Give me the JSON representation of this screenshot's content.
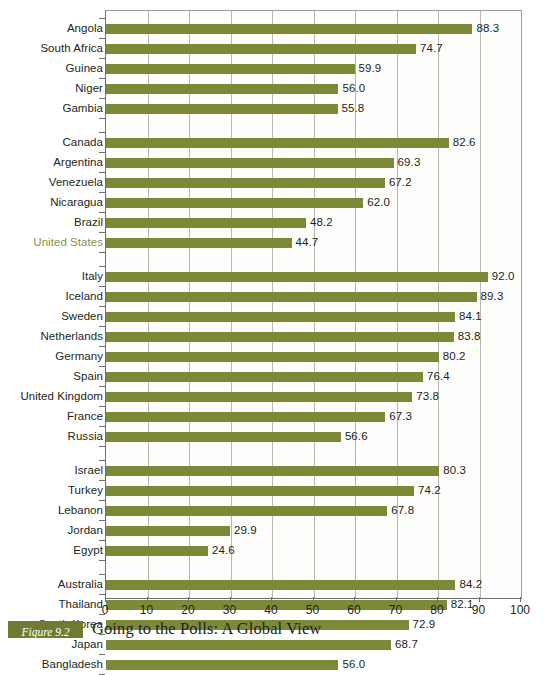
{
  "caption": {
    "figure_label": "Figure 9.2",
    "title": "Going to the Polls: A Global View"
  },
  "chart_data": {
    "type": "bar",
    "orientation": "horizontal",
    "title": "Going to the Polls: A Global View",
    "xlabel": "",
    "ylabel": "",
    "xlim": [
      0,
      100
    ],
    "xticks": [
      0,
      10,
      20,
      30,
      40,
      50,
      60,
      70,
      80,
      90,
      100
    ],
    "grid": true,
    "grid_axis": "x",
    "legend": "none",
    "bar_color": "#7c8a38",
    "highlight_color": "#8a8f4a",
    "highlighted_categories": [
      "United States"
    ],
    "value_label_format": "one-decimal",
    "groups": [
      {
        "name": "",
        "categories": [
          "Angola",
          "South Africa",
          "Guinea",
          "Niger",
          "Gambia"
        ],
        "values": [
          88.3,
          74.7,
          59.9,
          56.0,
          55.8
        ]
      },
      {
        "name": "",
        "categories": [
          "Canada",
          "Argentina",
          "Venezuela",
          "Nicaragua",
          "Brazil",
          "United States"
        ],
        "values": [
          82.6,
          69.3,
          67.2,
          62.0,
          48.2,
          44.7
        ]
      },
      {
        "name": "",
        "categories": [
          "Italy",
          "Iceland",
          "Sweden",
          "Netherlands",
          "Germany",
          "Spain",
          "United Kingdom",
          "France",
          "Russia"
        ],
        "values": [
          92.0,
          89.3,
          84.1,
          83.8,
          80.2,
          76.4,
          73.8,
          67.3,
          56.6
        ]
      },
      {
        "name": "",
        "categories": [
          "Israel",
          "Turkey",
          "Lebanon",
          "Jordan",
          "Egypt"
        ],
        "values": [
          80.3,
          74.2,
          67.8,
          29.9,
          24.6
        ]
      },
      {
        "name": "",
        "categories": [
          "Australia",
          "Thailand",
          "South Korea",
          "Japan",
          "Bangladesh"
        ],
        "values": [
          84.2,
          82.1,
          72.9,
          68.7,
          56.0
        ]
      }
    ],
    "categories": [
      "Angola",
      "South Africa",
      "Guinea",
      "Niger",
      "Gambia",
      "Canada",
      "Argentina",
      "Venezuela",
      "Nicaragua",
      "Brazil",
      "United States",
      "Italy",
      "Iceland",
      "Sweden",
      "Netherlands",
      "Germany",
      "Spain",
      "United Kingdom",
      "France",
      "Russia",
      "Israel",
      "Turkey",
      "Lebanon",
      "Jordan",
      "Egypt",
      "Australia",
      "Thailand",
      "South Korea",
      "Japan",
      "Bangladesh"
    ],
    "values": [
      88.3,
      74.7,
      59.9,
      56.0,
      55.8,
      82.6,
      69.3,
      67.2,
      62.0,
      48.2,
      44.7,
      92.0,
      89.3,
      84.1,
      83.8,
      80.2,
      76.4,
      73.8,
      67.3,
      56.6,
      80.3,
      74.2,
      67.8,
      29.9,
      24.6,
      84.2,
      82.1,
      72.9,
      68.7,
      56.0
    ]
  }
}
